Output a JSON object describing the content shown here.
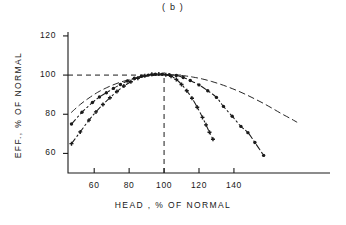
{
  "figure": {
    "panel_title": "( b )",
    "background_color": "#ffffff",
    "ink_color": "#1a1a1a"
  },
  "chart_data": {
    "type": "line",
    "title": "( b )",
    "xlabel": "HEAD , % OF NORMAL",
    "ylabel": "EFF., % OF NORMAL",
    "xlim": [
      45,
      195
    ],
    "ylim": [
      50,
      122
    ],
    "xticks": [
      60,
      80,
      100,
      120,
      140
    ],
    "yticks": [
      60,
      80,
      100,
      120
    ],
    "xtick_labels": [
      "60",
      "80",
      "100",
      "120",
      "140"
    ],
    "ytick_labels": [
      "60",
      "80",
      "100",
      "120"
    ],
    "grid": false,
    "legend": "none",
    "annotations": [
      {
        "name": "normal-head-reference",
        "type": "vline",
        "x": 100,
        "style": "dashed"
      },
      {
        "name": "normal-efficiency-reference",
        "type": "hline",
        "y": 100,
        "style": "dashed"
      }
    ],
    "series": [
      {
        "name": "broad-curve",
        "style": "dashed",
        "marker": "none",
        "points": [
          [
            47,
            81.0
          ],
          [
            52,
            85.0
          ],
          [
            57,
            88.3
          ],
          [
            62,
            91.2
          ],
          [
            67,
            93.5
          ],
          [
            72,
            95.4
          ],
          [
            77,
            96.9
          ],
          [
            82,
            98.0
          ],
          [
            87,
            99.0
          ],
          [
            92,
            99.6
          ],
          [
            97,
            100.0
          ],
          [
            102,
            100.1
          ],
          [
            107,
            100.0
          ],
          [
            112,
            99.6
          ],
          [
            117,
            98.9
          ],
          [
            122,
            98.0
          ],
          [
            127,
            96.8
          ],
          [
            132,
            95.4
          ],
          [
            137,
            93.8
          ],
          [
            142,
            92.0
          ],
          [
            147,
            90.0
          ],
          [
            152,
            87.8
          ],
          [
            157,
            85.5
          ],
          [
            162,
            83.0
          ],
          [
            167,
            80.4
          ],
          [
            172,
            78.0
          ],
          [
            176,
            76.0
          ]
        ]
      },
      {
        "name": "dot-marker-curve",
        "style": "dash-dot",
        "marker": "circle",
        "points": [
          [
            47,
            75.0
          ],
          [
            53,
            81.0
          ],
          [
            59,
            86.0
          ],
          [
            63,
            88.8
          ],
          [
            67,
            91.0
          ],
          [
            71,
            93.2
          ],
          [
            75,
            95.2
          ],
          [
            79,
            97.0
          ],
          [
            83,
            98.4
          ],
          [
            87,
            99.4
          ],
          [
            91,
            100.0
          ],
          [
            95,
            100.4
          ],
          [
            99,
            100.4
          ],
          [
            103,
            100.2
          ],
          [
            107,
            99.8
          ],
          [
            111,
            98.8
          ],
          [
            115,
            97.2
          ],
          [
            120,
            95.0
          ],
          [
            125,
            92.0
          ],
          [
            130,
            88.6
          ],
          [
            134,
            84.0
          ],
          [
            139,
            79.0
          ],
          [
            144,
            73.8
          ],
          [
            148,
            70.6
          ],
          [
            152,
            65.6
          ],
          [
            157,
            59.0
          ]
        ]
      },
      {
        "name": "cross-marker-curve",
        "style": "dash-dot",
        "marker": "cross",
        "points": [
          [
            47,
            65.0
          ],
          [
            52,
            71.0
          ],
          [
            57,
            77.0
          ],
          [
            61,
            81.2
          ],
          [
            65,
            85.0
          ],
          [
            69,
            88.4
          ],
          [
            73,
            91.6
          ],
          [
            77,
            94.4
          ],
          [
            81,
            96.6
          ],
          [
            85,
            98.4
          ],
          [
            89,
            99.6
          ],
          [
            93,
            100.4
          ],
          [
            97,
            100.5
          ],
          [
            101,
            100.2
          ],
          [
            104,
            99.4
          ],
          [
            107,
            97.8
          ],
          [
            110,
            95.2
          ],
          [
            113,
            92.0
          ],
          [
            116,
            88.2
          ],
          [
            119,
            83.6
          ],
          [
            122,
            78.4
          ],
          [
            124,
            74.6
          ],
          [
            126,
            70.8
          ],
          [
            128,
            67.2
          ]
        ]
      }
    ]
  }
}
